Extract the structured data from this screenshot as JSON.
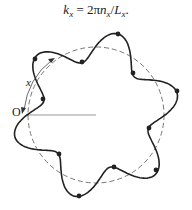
{
  "equation": {
    "lhs_var": "k",
    "lhs_sub": "x",
    "eq": " = 2π",
    "n_var": "n",
    "n_sub": "x",
    "slash": "/",
    "L_var": "L",
    "L_sub": "x",
    "end": "."
  },
  "diagram": {
    "origin_label": "O",
    "arc_label": "x",
    "circle": {
      "cx": 96,
      "cy": 115,
      "r": 68,
      "stroke": "#777777"
    },
    "wave": {
      "base_r": 69,
      "amplitude": 15,
      "lobes": 6,
      "phase_deg": 15,
      "stroke": "#222222"
    },
    "radius_line": {
      "x1": 27,
      "y1": 115,
      "x2": 96,
      "y2": 115,
      "stroke": "#999999"
    },
    "dots": [
      [
        35,
        59
      ],
      [
        82,
        62
      ],
      [
        118,
        34
      ],
      [
        133,
        73
      ],
      [
        177,
        91
      ],
      [
        149,
        128
      ],
      [
        156,
        170
      ],
      [
        114,
        167
      ],
      [
        79,
        196
      ],
      [
        59,
        154
      ],
      [
        43,
        99
      ]
    ]
  }
}
